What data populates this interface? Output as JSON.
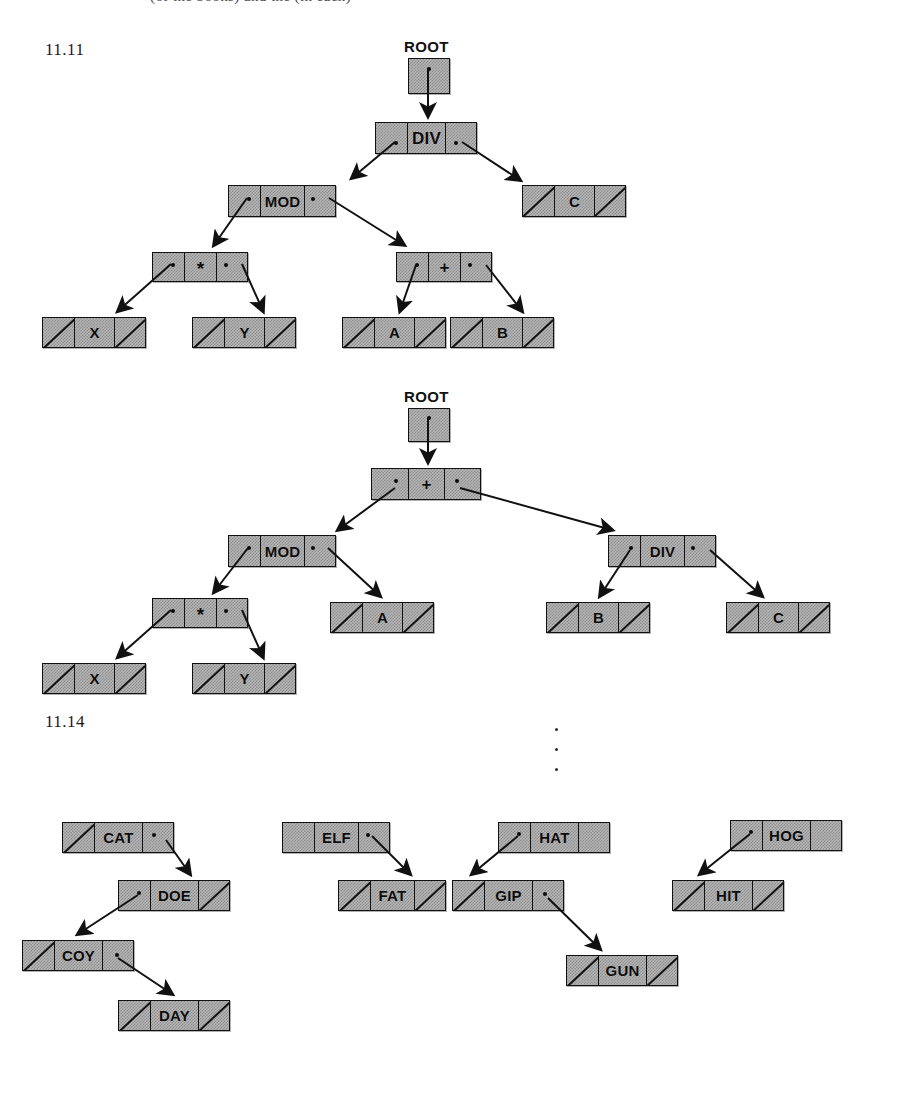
{
  "page": {
    "cut_header_text": "(of the books) and the (in each)",
    "background": "#ffffff",
    "node_fill": "#b5b5b5",
    "ink": "#111111"
  },
  "exercises": [
    {
      "id": "ex-11-11",
      "label": "11.11"
    },
    {
      "id": "ex-11-14",
      "label": "11.14"
    }
  ],
  "root_labels": {
    "tree1": "ROOT",
    "tree2": "ROOT"
  },
  "trees": [
    {
      "name": "expression-tree-1",
      "root_label": "ROOT",
      "nodes": [
        {
          "id": "t1-div",
          "value": "DIV",
          "left": "ptr",
          "right": "ptr",
          "x": 375,
          "y": 122,
          "w": 102
        },
        {
          "id": "t1-mod",
          "value": "MOD",
          "left": "ptr",
          "right": "ptr",
          "x": 228,
          "y": 185,
          "w": 108
        },
        {
          "id": "t1-c",
          "value": "C",
          "left": "null",
          "right": "null",
          "x": 522,
          "y": 185,
          "w": 104
        },
        {
          "id": "t1-mul",
          "value": "*",
          "left": "ptr",
          "right": "ptr",
          "x": 152,
          "y": 252,
          "w": 96
        },
        {
          "id": "t1-plus",
          "value": "+",
          "left": "ptr",
          "right": "ptr",
          "x": 396,
          "y": 252,
          "w": 96
        },
        {
          "id": "t1-x",
          "value": "X",
          "left": "null",
          "right": "null",
          "x": 42,
          "y": 317,
          "w": 104
        },
        {
          "id": "t1-y",
          "value": "Y",
          "left": "null",
          "right": "null",
          "x": 192,
          "y": 317,
          "w": 104
        },
        {
          "id": "t1-a",
          "value": "A",
          "left": "null",
          "right": "null",
          "x": 342,
          "y": 317,
          "w": 104
        },
        {
          "id": "t1-b",
          "value": "B",
          "left": "null",
          "right": "null",
          "x": 450,
          "y": 317,
          "w": 104
        }
      ]
    },
    {
      "name": "expression-tree-2",
      "root_label": "ROOT",
      "nodes": [
        {
          "id": "t2-plus",
          "value": "+",
          "left": "ptr",
          "right": "ptr",
          "x": 371,
          "y": 468,
          "w": 110
        },
        {
          "id": "t2-mod",
          "value": "MOD",
          "left": "ptr",
          "right": "ptr",
          "x": 228,
          "y": 535,
          "w": 108
        },
        {
          "id": "t2-div",
          "value": "DIV",
          "left": "ptr",
          "right": "ptr",
          "x": 608,
          "y": 535,
          "w": 108
        },
        {
          "id": "t2-mul",
          "value": "*",
          "left": "ptr",
          "right": "ptr",
          "x": 152,
          "y": 598,
          "w": 96
        },
        {
          "id": "t2-a",
          "value": "A",
          "left": "null",
          "right": "null",
          "x": 330,
          "y": 602,
          "w": 104
        },
        {
          "id": "t2-b",
          "value": "B",
          "left": "null",
          "right": "null",
          "x": 546,
          "y": 602,
          "w": 104
        },
        {
          "id": "t2-c",
          "value": "C",
          "left": "null",
          "right": "null",
          "x": 726,
          "y": 602,
          "w": 104
        },
        {
          "id": "t2-x",
          "value": "X",
          "left": "null",
          "right": "null",
          "x": 42,
          "y": 663,
          "w": 104
        },
        {
          "id": "t2-y",
          "value": "Y",
          "left": "null",
          "right": "null",
          "x": 192,
          "y": 663,
          "w": 104
        }
      ]
    },
    {
      "name": "word-tree-cat",
      "nodes": [
        {
          "id": "w-cat",
          "value": "CAT",
          "left": "null",
          "right": "ptr",
          "x": 62,
          "y": 822,
          "w": 112
        },
        {
          "id": "w-doe",
          "value": "DOE",
          "left": "ptr",
          "right": "null",
          "x": 118,
          "y": 880,
          "w": 112
        },
        {
          "id": "w-coy",
          "value": "COY",
          "left": "null",
          "right": "ptr",
          "x": 22,
          "y": 940,
          "w": 112
        },
        {
          "id": "w-day",
          "value": "DAY",
          "left": "null",
          "right": "null",
          "x": 118,
          "y": 1000,
          "w": 112
        }
      ]
    },
    {
      "name": "word-tree-elf",
      "nodes": [
        {
          "id": "w-elf",
          "value": "ELF",
          "left": "empty",
          "right": "ptr",
          "x": 282,
          "y": 822,
          "w": 108
        },
        {
          "id": "w-fat",
          "value": "FAT",
          "left": "null",
          "right": "null",
          "x": 338,
          "y": 880,
          "w": 108
        }
      ]
    },
    {
      "name": "word-tree-hat",
      "nodes": [
        {
          "id": "w-hat",
          "value": "HAT",
          "left": "ptr",
          "right": "empty",
          "x": 498,
          "y": 822,
          "w": 112
        },
        {
          "id": "w-gip",
          "value": "GIP",
          "left": "null",
          "right": "ptr",
          "x": 452,
          "y": 880,
          "w": 112
        },
        {
          "id": "w-gun",
          "value": "GUN",
          "left": "null",
          "right": "null",
          "x": 566,
          "y": 955,
          "w": 112
        }
      ]
    },
    {
      "name": "word-tree-hog",
      "nodes": [
        {
          "id": "w-hog",
          "value": "HOG",
          "left": "ptr",
          "right": "empty",
          "x": 730,
          "y": 820,
          "w": 112
        },
        {
          "id": "w-hit",
          "value": "HIT",
          "left": "null",
          "right": "null",
          "x": 672,
          "y": 880,
          "w": 112
        }
      ]
    }
  ]
}
